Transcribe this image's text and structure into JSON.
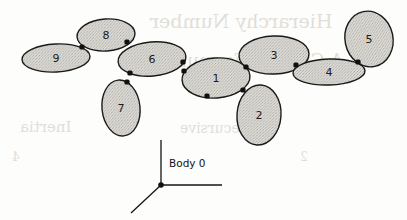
{
  "figure": {
    "kind": "multibody-kinematic-tree",
    "background_color": "#fdfdfb",
    "body_fill_color": "#d6d4cf",
    "body_stroke_color": "#1a1a1a",
    "joint_color": "#111111",
    "frame_label": "Body 0",
    "bodies": [
      {
        "label": "1",
        "cx": 216,
        "cy": 78,
        "rx": 34,
        "ry": 20,
        "rot": -4
      },
      {
        "label": "2",
        "cx": 259,
        "cy": 115,
        "rx": 22,
        "ry": 30,
        "rot": 4
      },
      {
        "label": "3",
        "cx": 274,
        "cy": 55,
        "rx": 35,
        "ry": 19,
        "rot": -2
      },
      {
        "label": "4",
        "cx": 329,
        "cy": 72,
        "rx": 36,
        "ry": 13,
        "rot": -2
      },
      {
        "label": "5",
        "cx": 369,
        "cy": 39,
        "rx": 24,
        "ry": 28,
        "rot": -12
      },
      {
        "label": "6",
        "cx": 152,
        "cy": 59,
        "rx": 34,
        "ry": 17,
        "rot": -5
      },
      {
        "label": "7",
        "cx": 121,
        "cy": 108,
        "rx": 19,
        "ry": 28,
        "rot": -6
      },
      {
        "label": "8",
        "cx": 106,
        "cy": 35,
        "rx": 29,
        "ry": 16,
        "rot": -4
      },
      {
        "label": "9",
        "cx": 56,
        "cy": 58,
        "rx": 34,
        "ry": 14,
        "rot": -3
      }
    ],
    "joints": [
      {
        "name": "joint-1-6",
        "x": 184,
        "y": 71
      },
      {
        "name": "joint-1-3",
        "x": 246,
        "y": 67
      },
      {
        "name": "joint-1-2",
        "x": 243,
        "y": 90
      },
      {
        "name": "joint-1-low",
        "x": 207,
        "y": 96
      },
      {
        "name": "joint-3-4",
        "x": 296,
        "y": 65
      },
      {
        "name": "joint-4-5",
        "x": 358,
        "y": 62
      },
      {
        "name": "joint-6-8",
        "x": 127,
        "y": 42
      },
      {
        "name": "joint-6-low",
        "x": 130,
        "y": 73
      },
      {
        "name": "joint-6-1",
        "x": 183,
        "y": 62
      },
      {
        "name": "joint-8-9",
        "x": 82,
        "y": 47
      },
      {
        "name": "joint-7",
        "x": 127,
        "y": 82
      }
    ],
    "frame": {
      "origin_x": 161,
      "origin_y": 185,
      "vertical_axis_end_y": 140,
      "horizontal_axis_end_x": 222,
      "diagonal_axis_end_x": 131,
      "diagonal_axis_end_y": 213,
      "label_x": 169,
      "label_y": 167
    },
    "bleed_through_text": [
      {
        "text": "Hierarchy Number",
        "x": 150,
        "y": 10,
        "size": 19
      },
      {
        "text": "A General Formulation",
        "x": 135,
        "y": 50,
        "size": 18
      },
      {
        "text": "Inertia",
        "x": 20,
        "y": 118,
        "size": 15
      },
      {
        "text": "Recursive",
        "x": 180,
        "y": 120,
        "size": 14
      },
      {
        "text": "4",
        "x": 12,
        "y": 150,
        "size": 12
      },
      {
        "text": "2",
        "x": 300,
        "y": 150,
        "size": 12
      }
    ]
  }
}
